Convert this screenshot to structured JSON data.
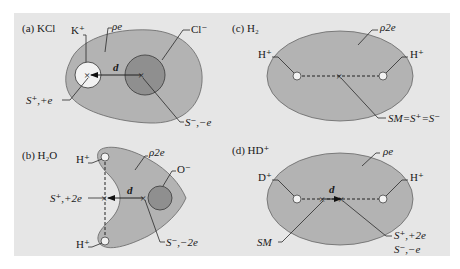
{
  "figure": {
    "background_color": "#e6e6e6",
    "cloud_color": "#b3b3b3",
    "ion_color": "#8f8f8f",
    "cation_fill": "#f2f2f2",
    "outline_color": "#555555"
  },
  "panels": [
    {
      "id": "a",
      "title": "(a) KCl",
      "density_label": "ρe",
      "ions": [
        "K⁺",
        "Cl⁻"
      ],
      "distance_label": "d",
      "centroid_labels": [
        "S⁺,+e",
        "S⁻,−e"
      ]
    },
    {
      "id": "b",
      "title": "(b) H₂O",
      "density_label": "ρ2e",
      "ions": [
        "H⁺",
        "H⁺",
        "O⁻"
      ],
      "distance_label": "d",
      "centroid_labels": [
        "S⁺,+2e",
        "S⁻,−2e"
      ]
    },
    {
      "id": "c",
      "title": "(c) H₂",
      "density_label": "ρ2e",
      "ions": [
        "H⁺",
        "H⁺"
      ],
      "centroid_labels": [
        "SM=S⁺=S⁻"
      ]
    },
    {
      "id": "d",
      "title": "(d) HD⁺",
      "density_label": "ρe",
      "ions": [
        "D⁺",
        "H⁺"
      ],
      "distance_label": "d",
      "centroid_labels": [
        "SM",
        "S⁺,+2e",
        "S⁻,−e"
      ]
    }
  ]
}
